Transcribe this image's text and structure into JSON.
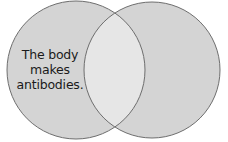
{
  "diagram": {
    "type": "venn",
    "sets": [
      {
        "id": "left",
        "label_lines": [
          "The body",
          "makes",
          "antibodies."
        ],
        "fill": "#d4d4d4"
      },
      {
        "id": "right",
        "label_lines": [],
        "fill": "#d4d4d4"
      }
    ],
    "intersection": {
      "label_lines": [],
      "fill": "#e6e6e6"
    },
    "stroke": "#6e6e6e"
  }
}
